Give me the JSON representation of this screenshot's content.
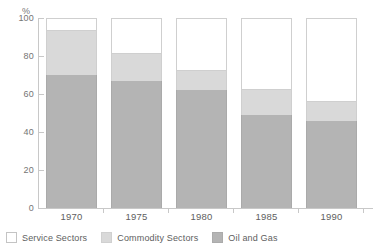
{
  "chart_data": {
    "type": "bar",
    "subtype": "stacked-bar-100",
    "title": "",
    "xlabel": "",
    "ylabel": "%",
    "ylim": [
      0,
      100
    ],
    "yticks": [
      0,
      20,
      40,
      60,
      80,
      100
    ],
    "ytick_labels": [
      "0",
      "20",
      "40",
      "60",
      "80",
      "100"
    ],
    "grid": false,
    "legend_position": "bottom-left",
    "categories": [
      "1970",
      "1975",
      "1980",
      "1985",
      "1990"
    ],
    "series": [
      {
        "name": "Oil and Gas",
        "color": "#b4b4b4",
        "values": [
          70,
          67,
          62,
          49,
          46
        ]
      },
      {
        "name": "Commodity Sectors",
        "color": "#d9d9d9",
        "values": [
          23,
          14,
          10,
          13,
          10
        ]
      },
      {
        "name": "Service Sectors",
        "color": "#ffffff",
        "values": [
          7,
          19,
          28,
          38,
          44
        ]
      }
    ],
    "cumulative_tops": {
      "oil_and_gas": [
        70,
        67,
        62,
        49,
        46
      ],
      "commodity_sectors": [
        93,
        81,
        72,
        62,
        56
      ],
      "service_sectors": [
        100,
        100,
        100,
        100,
        100
      ]
    }
  },
  "axis": {
    "unit": "%",
    "y_labels": [
      "100",
      "80",
      "60",
      "40",
      "20",
      "0"
    ],
    "x_labels": [
      "1970",
      "1975",
      "1980",
      "1985",
      "1990"
    ]
  },
  "legend": {
    "items": [
      {
        "label": "Service Sectors",
        "swatch": "white-square-icon"
      },
      {
        "label": "Commodity Sectors",
        "swatch": "light-gray-square-icon"
      },
      {
        "label": "Oil and Gas",
        "swatch": "dark-gray-square-icon"
      }
    ]
  },
  "colors": {
    "oil_and_gas": "#b4b4b4",
    "commodity_sectors": "#d9d9d9",
    "service_sectors": "#ffffff",
    "axis": "#c8c8c8",
    "text": "#5e5e5e"
  }
}
